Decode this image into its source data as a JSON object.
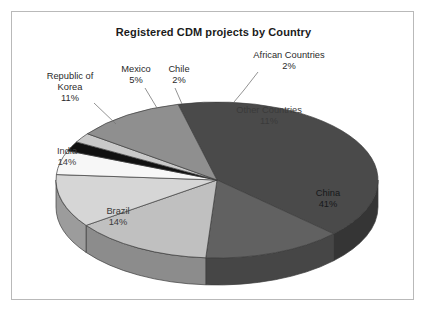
{
  "chart": {
    "title": "Registered CDM projects by Country"
  },
  "chart_data": {
    "type": "pie",
    "title": "Registered CDM projects by Country",
    "xlabel": "",
    "ylabel": "",
    "legend_position": "none",
    "grid": false,
    "value_unit": "%",
    "categories": [
      "China",
      "Brazil",
      "India",
      "Republic of Korea",
      "Mexico",
      "Chile",
      "African Countries",
      "Other Countries"
    ],
    "values": [
      41,
      14,
      14,
      11,
      5,
      2,
      2,
      11
    ],
    "labels": [
      "China\n41%",
      "Brazil\n14%",
      "India\n14%",
      "Republic of\nKorea\n11%",
      "Mexico\n5%",
      "Chile\n2%",
      "African Countries\n2%",
      "Other Countries\n11%"
    ],
    "slice_colors": [
      "#4a4a4a",
      "#616161",
      "#c0c0c0",
      "#d6d6d6",
      "#f7f7f7",
      "#111111",
      "#c9c9c9",
      "#8f8f8f"
    ],
    "side_colors": [
      "#353535",
      "#464646",
      "#8c8c8c",
      "#9c9c9c",
      "#b4b4b4",
      "#0a0a0a",
      "#949494",
      "#696969"
    ]
  },
  "labels": {
    "african": "African Countries\n2%",
    "chile": "Chile\n2%",
    "mexico": "Mexico\n5%",
    "korea": "Republic of\nKorea\n11%",
    "other": "Other Countries\n11%",
    "china": "China\n41%",
    "india": "India\n14%",
    "brazil": "Brazil\n14%"
  }
}
